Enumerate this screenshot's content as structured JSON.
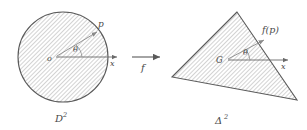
{
  "figure": {
    "background_color": "#ffffff",
    "ink_color": "#4a4a4a",
    "hatch_color": "#9a9a9a"
  },
  "left_shape": {
    "name": "disk",
    "label": "D",
    "exponent": "2",
    "center_label": "o",
    "boundary_point_label": "p",
    "angle_label": "θ",
    "axis_label": "x"
  },
  "map_arrow": {
    "label": "f"
  },
  "right_shape": {
    "name": "triangle",
    "label": "Δ",
    "exponent": "2",
    "center_label": "G",
    "boundary_point_label": "f(p)",
    "angle_label": "θ",
    "axis_label": "x"
  }
}
